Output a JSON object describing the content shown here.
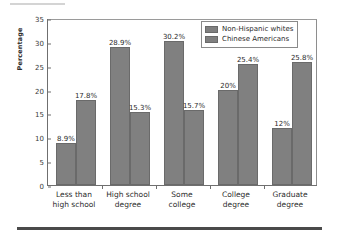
{
  "chart_data": {
    "type": "bar",
    "title": "",
    "xlabel": "",
    "ylabel": "Percentage",
    "ylim": [
      0,
      35
    ],
    "yticks": [
      0,
      5,
      10,
      15,
      20,
      25,
      30,
      35
    ],
    "ytick_labels": [
      "0",
      "5",
      "10",
      "15",
      "20",
      "25",
      "30",
      "35"
    ],
    "grid": false,
    "legend_position": "top-right",
    "categories": [
      "Less than high school",
      "High school degree",
      "Some college",
      "College degree",
      "Graduate degree"
    ],
    "category_lines": [
      [
        "Less than",
        "high school"
      ],
      [
        "High school",
        "degree"
      ],
      [
        "Some",
        "college"
      ],
      [
        "College",
        "degree"
      ],
      [
        "Graduate",
        "degree"
      ]
    ],
    "series": [
      {
        "name": "Non-Hispanic whites",
        "color": "#808080",
        "values": [
          8.9,
          28.9,
          30.2,
          20.0,
          12.0
        ],
        "labels": [
          "8.9%",
          "28.9%",
          "30.2%",
          "20%",
          "12%"
        ]
      },
      {
        "name": "Chinese Americans",
        "color": "#808080",
        "values": [
          17.8,
          15.3,
          15.7,
          25.4,
          25.8
        ],
        "labels": [
          "17.8%",
          "15.3%",
          "15.7%",
          "25.4%",
          "25.8%"
        ]
      }
    ]
  },
  "legend": {
    "entries": [
      {
        "label": "Non-Hispanic whites"
      },
      {
        "label": "Chinese Americans"
      }
    ]
  },
  "colors": {
    "bar_fill": "#808080",
    "bar_edge": "#6a6a6a",
    "axis": "#6f6f6f",
    "text": "#2b2b2b",
    "rule": "#4a4a4a"
  }
}
